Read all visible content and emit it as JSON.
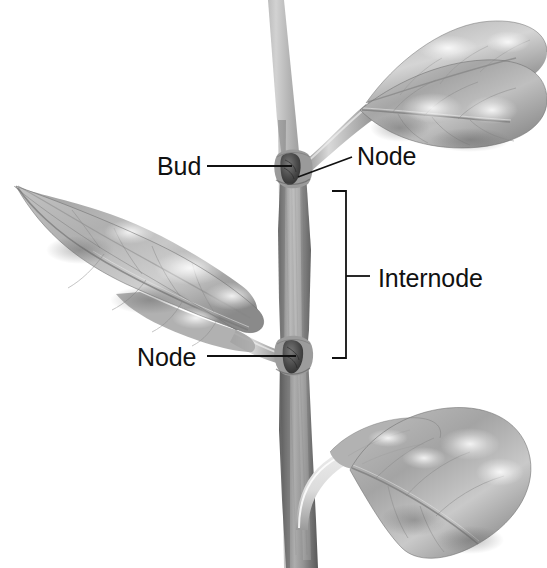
{
  "figure": {
    "style": "grayscale-pencil-illustration",
    "background_color": "#ffffff",
    "line_color": "#111111",
    "width": 547,
    "height": 568
  },
  "labels": {
    "bud": "Bud",
    "node_upper": "Node",
    "node_lower": "Node",
    "internode": "Internode"
  },
  "annotations": {
    "bud_leader": {
      "type": "straight-line",
      "from_x": 207,
      "from_y": 166,
      "to_x": 292,
      "to_y": 166
    },
    "node_upper_leader": {
      "type": "straight-line",
      "from_x": 352,
      "from_y": 157,
      "to_x": 298,
      "to_y": 177
    },
    "node_lower_leader": {
      "type": "straight-line",
      "from_x": 207,
      "from_y": 356,
      "to_x": 296,
      "to_y": 356
    },
    "internode_bracket": {
      "type": "square-bracket",
      "x": 346,
      "top_y": 191,
      "bottom_y": 358,
      "arm_length": 14,
      "tick_y": 276,
      "tick_length": 22
    }
  },
  "plant_parts": {
    "stem": {
      "name": "main-stem",
      "tone": "#8e8e8e"
    },
    "leaf_upper_right": {
      "name": "upper-right-leaf",
      "tone": "#9a9a9a"
    },
    "leaf_left": {
      "name": "left-leaf",
      "tone": "#9a9a9a"
    },
    "leaf_lower_right": {
      "name": "lower-right-leaf",
      "tone": "#9a9a9a"
    },
    "bud_upper": {
      "name": "axillary-bud",
      "tone": "#4a4a4a"
    },
    "node_lower_bud": {
      "name": "lower-node-bud",
      "tone": "#4a4a4a"
    }
  },
  "palette": {
    "ink": "#111111",
    "stem_light": "#c9c9c9",
    "stem_mid": "#8e8e8e",
    "stem_dark": "#5a5a5a",
    "leaf_light": "#d8d8d8",
    "leaf_mid": "#a2a2a2",
    "leaf_dark": "#6e6e6e",
    "highlight": "#f2f2f2"
  }
}
